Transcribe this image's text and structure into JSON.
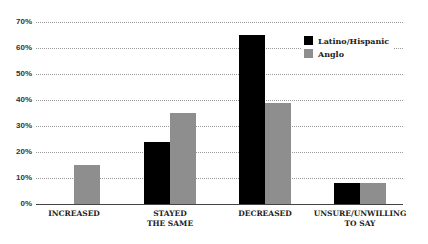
{
  "chart_data": {
    "type": "bar",
    "title": "",
    "xlabel": "",
    "ylabel": "",
    "ylim": [
      0,
      70
    ],
    "yticks": [
      "0%",
      "10%",
      "20%",
      "30%",
      "40%",
      "50%",
      "60%",
      "70%"
    ],
    "grid": true,
    "legend_position": "upper right",
    "categories": [
      "INCREASED",
      "STAYED THE SAME",
      "DECREASED",
      "UNSURE/UNWILLING TO SAY"
    ],
    "category_lines": [
      [
        "INCREASED"
      ],
      [
        "STAYED",
        "THE SAME"
      ],
      [
        "DECREASED"
      ],
      [
        "UNSURE/UNWILLING",
        "TO SAY"
      ]
    ],
    "series": [
      {
        "name": "Latino/Hispanic",
        "color": "#000000",
        "values": [
          0,
          24,
          65,
          8
        ]
      },
      {
        "name": "Anglo",
        "color": "#8e8e8e",
        "values": [
          15,
          35,
          39,
          8
        ]
      }
    ]
  },
  "legend": {
    "items": [
      {
        "label": "Latino/Hispanic",
        "color": "#000000"
      },
      {
        "label": "Anglo",
        "color": "#8e8e8e"
      }
    ]
  }
}
